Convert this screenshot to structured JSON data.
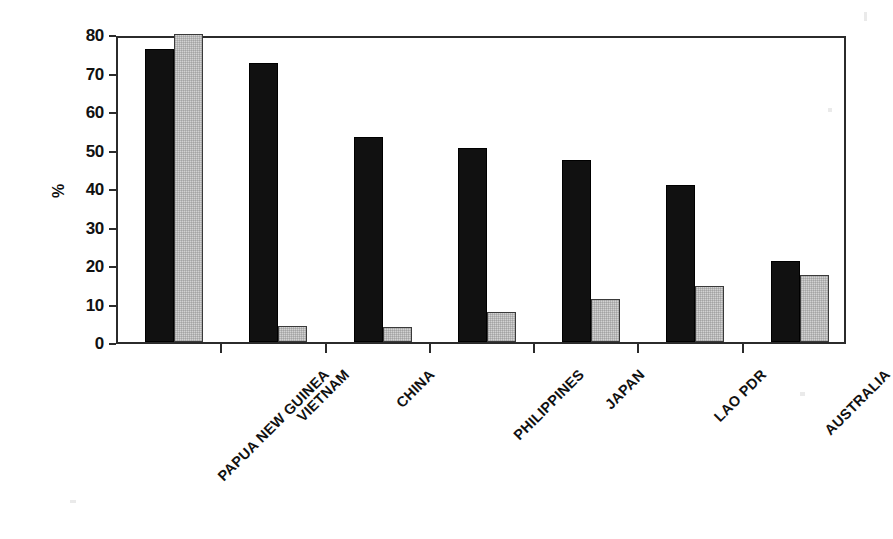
{
  "chart_data": {
    "type": "bar",
    "title": "",
    "subtitle": "",
    "xlabel": "",
    "ylabel": "%",
    "ylim": [
      0,
      80
    ],
    "yticks": [
      0,
      10,
      20,
      30,
      40,
      50,
      60,
      70,
      80
    ],
    "ytick_labels": [
      "0",
      "10",
      "20",
      "30",
      "40",
      "50",
      "60",
      "70",
      "80"
    ],
    "grid": false,
    "legend": "none",
    "categories": [
      "PAPUA NEW GUINEA",
      "VIETNAM",
      "CHINA",
      "PHILIPPINES",
      "JAPAN",
      "LAO PDR",
      "AUSTRALIA"
    ],
    "series": [
      {
        "name": "series-1-dark",
        "color": "#111111",
        "values": [
          76.2,
          72.6,
          53.2,
          50.4,
          47.3,
          40.8,
          21.0
        ]
      },
      {
        "name": "series-2-light",
        "color": "#d2d2d2",
        "values": [
          80.0,
          4.2,
          3.9,
          7.9,
          11.3,
          14.6,
          17.5
        ]
      }
    ]
  },
  "axis": {
    "y_title": "%",
    "frame_color": "#2b2b2b"
  }
}
